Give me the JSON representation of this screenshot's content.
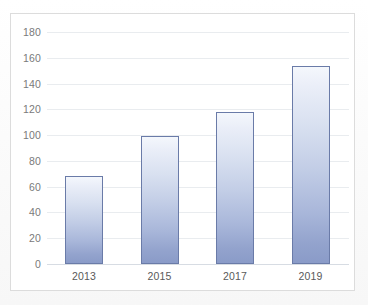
{
  "chart_data": {
    "type": "bar",
    "title": "",
    "subtitle": "",
    "xlabel": "",
    "ylabel": "",
    "categories": [
      "2013",
      "2015",
      "2017",
      "2019"
    ],
    "values": [
      68,
      99,
      118,
      154
    ],
    "series": [
      {
        "name": "",
        "values": [
          68,
          99,
          118,
          154
        ]
      }
    ],
    "ylim": [
      0,
      180
    ],
    "ytick_step": 20,
    "ytick_labels": [
      "0",
      "20",
      "40",
      "60",
      "80",
      "100",
      "120",
      "140",
      "160",
      "180"
    ],
    "ytick_values": [
      0,
      20,
      40,
      60,
      80,
      100,
      120,
      140,
      160,
      180
    ],
    "xtick_labels": [
      "2013",
      "2015",
      "2017",
      "2019"
    ],
    "grid": true,
    "grid_axis": "y",
    "legend": false,
    "legend_position": "none",
    "annotations": [],
    "colors": {
      "bar_top": "#f4f7fc",
      "bar_bottom": "#8a9bc8",
      "bar_border": "#6a7ba8",
      "gridline": "#e9ecef",
      "axis_line": "#d7dce3",
      "ytick_text": "#7a7a7a",
      "xtick_text": "#595959",
      "plot_background": "#ffffff",
      "frame_border": "#dcdcdc",
      "page_background": "#fcfcfc"
    }
  }
}
